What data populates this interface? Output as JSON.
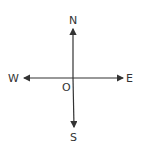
{
  "diagram": {
    "type": "compass-directions",
    "labels": {
      "north": "N",
      "south": "S",
      "east": "E",
      "west": "W",
      "origin": "O"
    },
    "line_color": "#333333"
  }
}
